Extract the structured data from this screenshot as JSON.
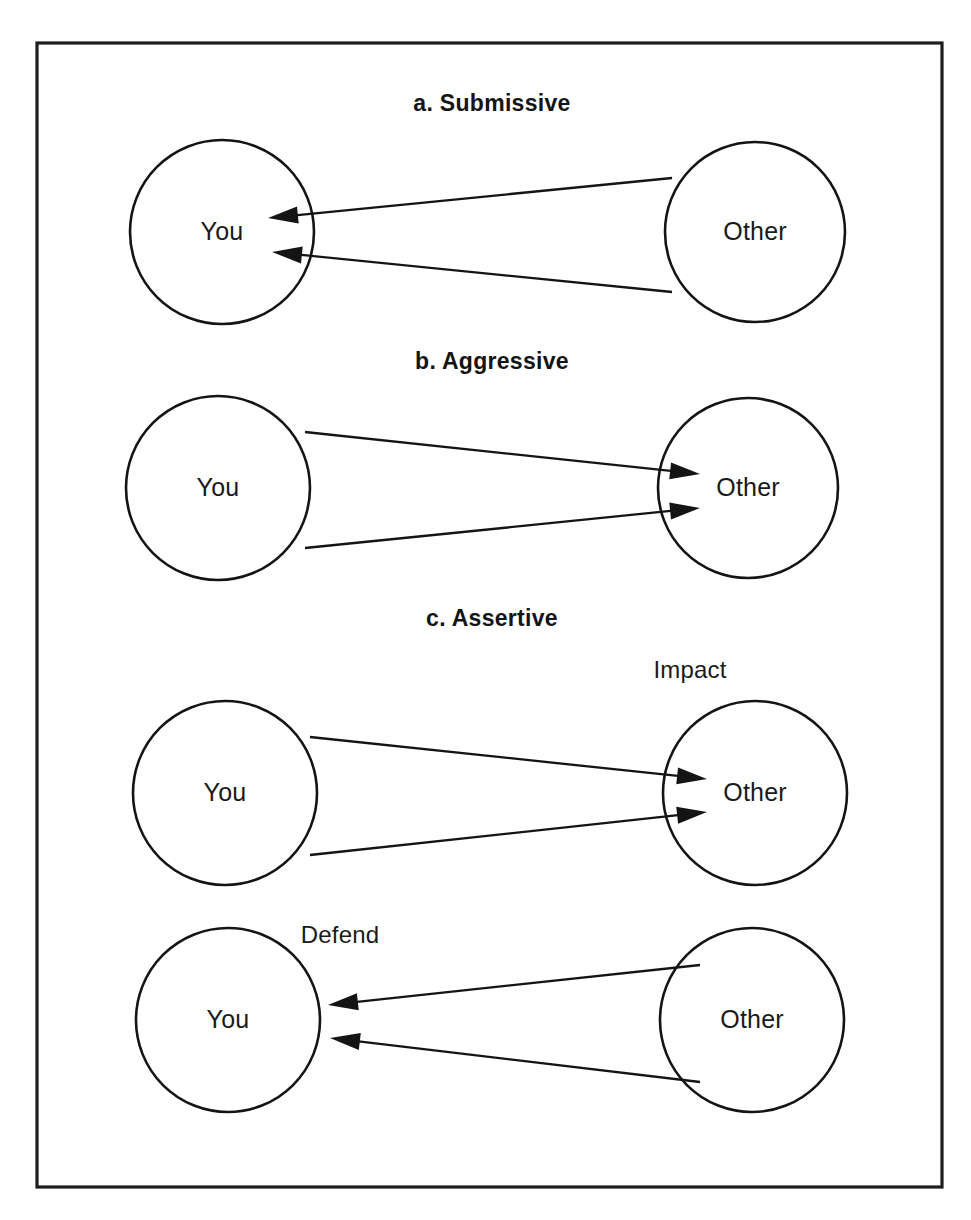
{
  "figure": {
    "width": 971,
    "height": 1220,
    "background_color": "#ffffff",
    "border_color": "#1d1d1d",
    "ink_color": "#141414",
    "frame": {
      "x": 37,
      "y": 43,
      "width": 905,
      "height": 1144
    }
  },
  "chart_data": {
    "type": "diagram",
    "title": "",
    "panels": [
      {
        "id": "a",
        "heading": "a.  Submissive",
        "heading_pos": {
          "x": 492,
          "y": 105
        },
        "nodes": [
          {
            "id": "you-a",
            "label": "You",
            "cx": 222,
            "cy": 232,
            "r": 92
          },
          {
            "id": "other-a",
            "label": "Other",
            "cx": 755,
            "cy": 232,
            "r": 90
          }
        ],
        "arrows": [
          {
            "from": "other-a",
            "to": "you-a",
            "direction": "left",
            "x1": 672,
            "y1": 178,
            "x2": 268,
            "y2": 218
          },
          {
            "from": "other-a",
            "to": "you-a",
            "direction": "left",
            "x1": 672,
            "y1": 292,
            "x2": 272,
            "y2": 252
          }
        ],
        "flow_labels": []
      },
      {
        "id": "b",
        "heading": "b.  Aggressive",
        "heading_pos": {
          "x": 492,
          "y": 363
        },
        "nodes": [
          {
            "id": "you-b",
            "label": "You",
            "cx": 218,
            "cy": 488,
            "r": 92
          },
          {
            "id": "other-b",
            "label": "Other",
            "cx": 748,
            "cy": 488,
            "r": 90
          }
        ],
        "arrows": [
          {
            "from": "you-b",
            "to": "other-b",
            "direction": "right",
            "x1": 305,
            "y1": 432,
            "x2": 700,
            "y2": 474
          },
          {
            "from": "you-b",
            "to": "other-b",
            "direction": "right",
            "x1": 305,
            "y1": 548,
            "x2": 700,
            "y2": 508
          }
        ],
        "flow_labels": []
      },
      {
        "id": "c",
        "heading": "c.  Assertive",
        "heading_pos": {
          "x": 492,
          "y": 620
        },
        "nodes": [
          {
            "id": "you-c",
            "label": "You",
            "cx": 225,
            "cy": 793,
            "r": 92
          },
          {
            "id": "other-c",
            "label": "Other",
            "cx": 755,
            "cy": 793,
            "r": 92
          }
        ],
        "arrows": [
          {
            "from": "you-c",
            "to": "other-c",
            "direction": "right",
            "x1": 310,
            "y1": 737,
            "x2": 707,
            "y2": 779
          },
          {
            "from": "you-c",
            "to": "other-c",
            "direction": "right",
            "x1": 310,
            "y1": 855,
            "x2": 707,
            "y2": 812
          }
        ],
        "flow_labels": [
          {
            "text": "Impact",
            "x": 690,
            "y": 672
          }
        ]
      },
      {
        "id": "d",
        "heading": "",
        "heading_pos": null,
        "nodes": [
          {
            "id": "you-d",
            "label": "You",
            "cx": 228,
            "cy": 1020,
            "r": 92
          },
          {
            "id": "other-d",
            "label": "Other",
            "cx": 752,
            "cy": 1020,
            "r": 92
          }
        ],
        "arrows": [
          {
            "from": "other-d",
            "to": "you-d",
            "direction": "left",
            "x1": 700,
            "y1": 965,
            "x2": 328,
            "y2": 1005
          },
          {
            "from": "other-d",
            "to": "you-d",
            "direction": "left",
            "x1": 700,
            "y1": 1082,
            "x2": 330,
            "y2": 1038
          }
        ],
        "flow_labels": [
          {
            "text": "Defend",
            "x": 340,
            "y": 937
          }
        ]
      }
    ]
  }
}
